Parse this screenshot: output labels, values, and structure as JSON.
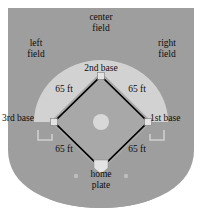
{
  "diagram": {
    "zones": {
      "center_field": "center\nfield",
      "center_field_line1": "center",
      "center_field_line2": "field",
      "left_field_line1": "left",
      "left_field_line2": "field",
      "right_field_line1": "right",
      "right_field_line2": "field"
    },
    "bases": {
      "second": "2nd base",
      "third": "3rd base",
      "first": "1st base",
      "home_line1": "home",
      "home_line2": "plate"
    },
    "distances": {
      "third_to_second": "65 ft",
      "second_to_first": "65 ft",
      "home_to_third": "65 ft",
      "home_to_first": "65 ft"
    },
    "colors": {
      "outfield_grass": "#9e9e9e",
      "infield_arc": "#d2d2d2",
      "infield_dirt": "#a8a8a8",
      "base_white": "#e3e3e3",
      "baseline": "#000000",
      "page_background": "#ffffff",
      "text": "#0d0d0d"
    }
  }
}
